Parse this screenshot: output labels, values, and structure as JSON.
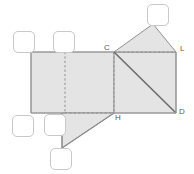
{
  "figure": {
    "canvas": {
      "width": 194,
      "height": 174
    },
    "style": {
      "fill": "#e4e4e4",
      "stroke": "#9a9a9a",
      "dark_stroke": "#6d6d6d",
      "dashed_stroke": "#8e8e8e",
      "label_color": "#5a5a5a",
      "box_border": "#c8c8c8",
      "background": "#ffffff"
    },
    "shapes": [
      {
        "name": "main-rectangle",
        "type": "rectangle",
        "points": "31,52 114,52 114,113 31,113"
      },
      {
        "name": "right-square",
        "type": "square",
        "points": "114,52 176,52 176,113 114,113"
      },
      {
        "name": "apex-triangle",
        "type": "triangle",
        "points": "114,52 153,24 176,52"
      },
      {
        "name": "lower-left-triangle",
        "type": "triangle",
        "points": "62,113 114,113 62,148"
      }
    ],
    "lines": [
      {
        "name": "rect-midline",
        "style": "dashed",
        "points": "65,52 65,113"
      },
      {
        "name": "rect-right-edge-dashed",
        "style": "dashed",
        "points": "114,52 114,113"
      },
      {
        "name": "rect-bottom-right-dashed",
        "style": "dashed",
        "points": "65,113 114,113"
      },
      {
        "name": "square-top-dashed",
        "style": "dashed",
        "points": "114,52 176,52"
      },
      {
        "name": "square-diagonal",
        "style": "solid-dark",
        "points": "114,52 176,113"
      }
    ],
    "vertex_labels": [
      {
        "name": "vertex-label-c",
        "text": "C",
        "x": 104,
        "y": 44
      },
      {
        "name": "vertex-label-l",
        "text": "L",
        "x": 180,
        "y": 45
      },
      {
        "name": "vertex-label-h",
        "text": "H",
        "x": 115,
        "y": 114
      },
      {
        "name": "vertex-label-d",
        "text": "D",
        "x": 179,
        "y": 108
      }
    ],
    "answer_boxes": [
      {
        "name": "answer-box-top-right",
        "x": 147,
        "y": 4,
        "width": 22,
        "height": 22
      },
      {
        "name": "answer-box-left-upper",
        "x": 13,
        "y": 31,
        "width": 22,
        "height": 22
      },
      {
        "name": "answer-box-mid-upper",
        "x": 53,
        "y": 31,
        "width": 22,
        "height": 22
      },
      {
        "name": "answer-box-left-lower",
        "x": 12,
        "y": 115,
        "width": 22,
        "height": 22
      },
      {
        "name": "answer-box-mid-lower",
        "x": 44,
        "y": 114,
        "width": 22,
        "height": 22
      },
      {
        "name": "answer-box-bottom",
        "x": 50,
        "y": 148,
        "width": 22,
        "height": 22
      }
    ]
  }
}
